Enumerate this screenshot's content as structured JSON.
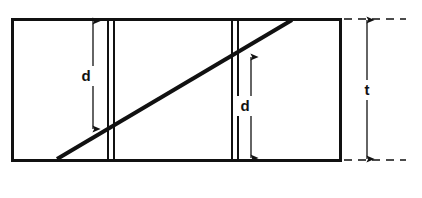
{
  "figure": {
    "background_color": "#ffffff",
    "line_color": "#111111",
    "stroke_widths": {
      "outline": 3,
      "diagonal": 4,
      "internal_rule": 1.6,
      "dimension": 1.3,
      "dashed_extension": 1.6
    }
  },
  "plate": {
    "name": "plate-outline",
    "x": 12,
    "y": 19,
    "width": 328,
    "height": 141
  },
  "diagonal": {
    "name": "inclined-defect-line",
    "x1": 57,
    "y1": 159,
    "x2": 292,
    "y2": 20
  },
  "internal_rules": [
    {
      "name": "left-rule-a",
      "x": 108,
      "y1": 19,
      "y2": 160
    },
    {
      "name": "left-rule-b",
      "x": 114,
      "y1": 19,
      "y2": 160
    },
    {
      "name": "right-rule-a",
      "x": 232,
      "y1": 19,
      "y2": 160
    },
    {
      "name": "right-rule-b",
      "x": 238,
      "y1": 19,
      "y2": 160
    }
  ],
  "dimensions": [
    {
      "id": "d-left",
      "label": "d",
      "label_x": 86,
      "label_y": 76,
      "line_x": 93,
      "y_top": 21,
      "y_bottom": 129,
      "arrow_top": true,
      "arrow_bottom": true
    },
    {
      "id": "d-right",
      "label": "d",
      "label_x": 245,
      "label_y": 106,
      "line_x": 251,
      "y_top": 57,
      "y_bottom": 158,
      "arrow_top": true,
      "arrow_bottom": true
    },
    {
      "id": "t-thickness",
      "label": "t",
      "label_x": 367,
      "label_y": 90,
      "line_x": 367,
      "y_top": 20,
      "y_bottom": 159,
      "arrow_top": true,
      "arrow_bottom": true
    }
  ],
  "extension_lines": [
    {
      "name": "extension-line-top",
      "y": 19,
      "x1": 344,
      "x2": 406
    },
    {
      "name": "extension-line-bottom",
      "y": 160,
      "x1": 344,
      "x2": 406
    }
  ]
}
